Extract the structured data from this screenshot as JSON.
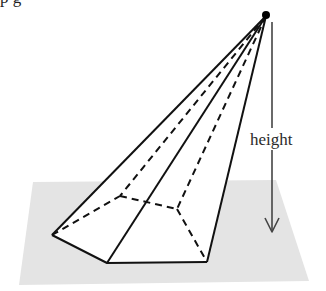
{
  "figure": {
    "height_label": "height",
    "cropped_top_text": "p                 g",
    "colors": {
      "plane": "#e4e4e4",
      "lines": "#111111",
      "arrow": "#444444",
      "apex_dot": "#000000"
    },
    "apex": [
      266,
      16
    ],
    "base_vertices_visible": [
      [
        52,
        235
      ],
      [
        107,
        263
      ],
      [
        207,
        262
      ]
    ],
    "base_vertices_hidden": [
      [
        120,
        196
      ],
      [
        177,
        209
      ]
    ],
    "plane_corners": [
      [
        33,
        182
      ],
      [
        276,
        180
      ],
      [
        309,
        281
      ],
      [
        19,
        285
      ]
    ],
    "height_arrow": {
      "x": 272,
      "y_start": 22,
      "y_end": 232
    }
  }
}
